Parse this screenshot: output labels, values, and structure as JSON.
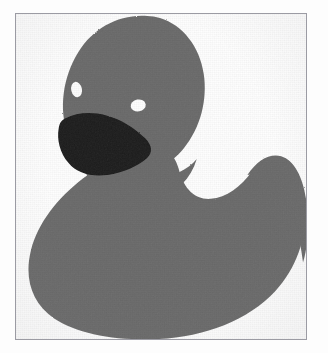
{
  "page": {
    "background_color": "#fdfdfd",
    "top_text_fragment": "nnnnnnnnnnnnn   nnnnnn    nnnnnnnn"
  },
  "figure": {
    "frame": {
      "border_color": "#9b9ba3",
      "fill_color": "#ffffff",
      "x": 15,
      "y": 13,
      "width": 292,
      "height": 327
    },
    "colors": {
      "body": "#6b6b6b",
      "body_shade": "#5f5f5f",
      "beak": "#1a1a1a",
      "eye": "#ffffff",
      "outline": "none"
    },
    "parts": [
      {
        "name": "body",
        "label": "Body"
      },
      {
        "name": "tail",
        "label": "Tail"
      },
      {
        "name": "head",
        "label": "Head"
      },
      {
        "name": "beak",
        "label": "Beak"
      },
      {
        "name": "eye-left",
        "label": "Left eye"
      },
      {
        "name": "eye-right",
        "label": "Right eye"
      }
    ],
    "shapes": {
      "body_path": "M 150 140 C 96 140 52 168 30 206 C 10 241 12 283 38 304 C 66 327 118 334 166 330 C 220 326 262 300 281 258 C 295 227 294 191 288 170 C 284 156 276 147 266 145 C 253 142 241 150 232 163 C 221 178 208 186 193 184 C 178 182 170 170 166 157 C 163 147 158 140 150 140 Z",
      "tail_path": "M 233 162 C 243 148 254 141 266 144 C 278 148 288 163 292 185 C 295 203 295 224 290 244 C 286 214 277 190 265 176 C 255 164 244 160 233 162 Z",
      "head_path": "M 130 3 C 100 3 74 20 61 46 C 48 72 47 104 57 126 C 66 145 83 156 104 159 C 128 162 152 153 167 135 C 183 116 190 89 186 63 C 182 36 166 14 144 6 C 139 4 134 3 130 3 Z",
      "beak_path": "M 48 104 C 58 100 72 100 86 104 C 100 108 114 116 124 126 C 131 133 133 139 128 144 C 120 151 106 157 92 159 C 76 161 63 158 55 150 C 46 141 42 127 43 116 C 44 109 45 106 48 104 Z",
      "eye_left": {
        "cx": 61,
        "cy": 75,
        "rx": 5.2,
        "ry": 7.6,
        "rotate": -10
      },
      "eye_right": {
        "cx": 122,
        "cy": 91,
        "rx": 7.4,
        "ry": 5.8,
        "rotate": -8
      }
    }
  }
}
